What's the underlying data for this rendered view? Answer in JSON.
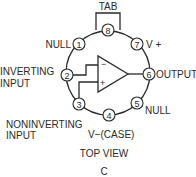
{
  "diagram": {
    "title": "TOP VIEW",
    "caption": "C",
    "tab_label": "TAB",
    "opamp": {
      "inverting_symbol": "−",
      "noninverting_symbol": "+"
    },
    "pins": [
      {
        "number": "1",
        "label": "NULL"
      },
      {
        "number": "2",
        "label": "INVERTING",
        "label2": "INPUT"
      },
      {
        "number": "3",
        "label": "NONINVERTING",
        "label2": "INPUT"
      },
      {
        "number": "4",
        "label": "V−(CASE)"
      },
      {
        "number": "5",
        "label": "NULL"
      },
      {
        "number": "6",
        "label": "OUTPUT"
      },
      {
        "number": "7",
        "label": "V +"
      },
      {
        "number": "8",
        "label": ""
      }
    ]
  }
}
